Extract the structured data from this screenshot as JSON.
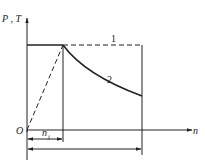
{
  "diagram": {
    "y_axis_label": "P , T",
    "x_axis_label": "n",
    "origin_label": "O",
    "curve_labels": [
      "1",
      "2"
    ],
    "dimension_label": "n",
    "dimension_subscript": "j",
    "colors": {
      "line": "#222222",
      "background": "#ffffff"
    }
  }
}
